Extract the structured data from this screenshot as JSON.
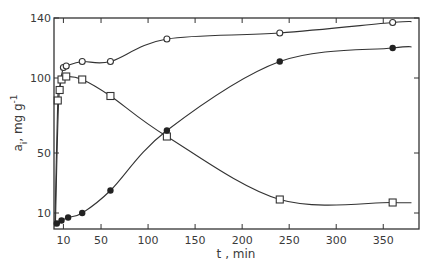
{
  "chart_data": {
    "type": "line",
    "title": "",
    "xlabel": "t , min",
    "ylabel": "a_i , mg g^-1",
    "ylabel_parts": {
      "main": "a",
      "sub": "i",
      "unit": ", mg g",
      "sup": "-1"
    },
    "xlim": [
      0,
      388
    ],
    "ylim": [
      0,
      140
    ],
    "x_ticks": [
      10,
      50,
      100,
      150,
      200,
      250,
      300,
      350
    ],
    "x_tick_labels": [
      "10",
      "50",
      "100",
      "150",
      "200",
      "250",
      "300",
      "350"
    ],
    "y_ticks": [
      10,
      50,
      100,
      140
    ],
    "y_tick_labels": [
      "10",
      "50",
      "100",
      "140"
    ],
    "grid": false,
    "legend": null,
    "series": [
      {
        "name": "open-circles",
        "marker": "open-circle",
        "x": [
          10,
          13,
          30,
          60,
          120,
          240,
          360
        ],
        "y": [
          107,
          108,
          111,
          111,
          126,
          130,
          137
        ]
      },
      {
        "name": "open-squares",
        "marker": "open-square",
        "x": [
          4,
          6,
          8,
          13,
          30,
          60,
          120,
          240,
          360
        ],
        "y": [
          85,
          92,
          99,
          101,
          99,
          88,
          61,
          19,
          17
        ]
      },
      {
        "name": "filled-circles",
        "marker": "filled-circle",
        "x": [
          3,
          8,
          15,
          30,
          60,
          120,
          240,
          360
        ],
        "y": [
          3,
          5,
          7,
          10,
          25,
          65,
          111,
          120
        ]
      }
    ],
    "colors": {
      "line": "#333333",
      "marker": "#222222",
      "background": "#ffffff"
    }
  }
}
